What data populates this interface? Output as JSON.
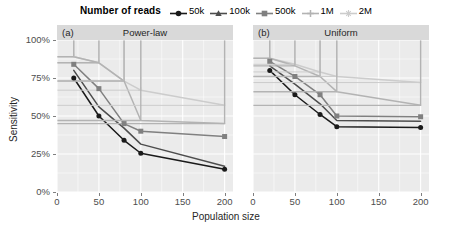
{
  "chart_data": {
    "type": "line",
    "title": "",
    "legend_title": "Number of reads",
    "legend_position": "top",
    "xlabel": "Population size",
    "ylabel": "Sensitivity",
    "xlim": [
      0,
      210
    ],
    "ylim": [
      0,
      100
    ],
    "xticks": [
      0,
      50,
      100,
      150,
      200
    ],
    "yticks": [
      0,
      25,
      50,
      75,
      100
    ],
    "ytick_labels": [
      "0%",
      "25%",
      "50%",
      "75%",
      "100%"
    ],
    "xtick_labels": [
      "0",
      "50",
      "100",
      "150",
      "200"
    ],
    "grid": true,
    "panels": [
      {
        "tag": "(a)",
        "title": "Power-law",
        "x": [
          20,
          50,
          80,
          100,
          200
        ],
        "series": [
          {
            "name": "50k",
            "color": "#1a1a1a",
            "marker": "circle",
            "values": [
              75,
              50,
              34,
              25.5,
              15
            ]
          },
          {
            "name": "100k",
            "color": "#4d4d4d",
            "marker": "triangle",
            "values": [
              80,
              56,
              42,
              31.5,
              17
            ]
          },
          {
            "name": "500k",
            "color": "#808080",
            "marker": "square",
            "values": [
              84,
              68,
              45,
              40,
              36.5
            ]
          },
          {
            "name": "1M",
            "color": "#b3b3b3",
            "marker": "plus",
            "values": [
              89,
              85,
              73,
              47,
              45
            ]
          },
          {
            "name": "2M",
            "color": "#cccccc",
            "marker": "asterisk",
            "values": [
              89,
              85,
              73,
              67,
              57
            ]
          }
        ]
      },
      {
        "tag": "(b)",
        "title": "Uniform",
        "x": [
          20,
          50,
          80,
          100,
          200
        ],
        "series": [
          {
            "name": "50k",
            "color": "#1a1a1a",
            "marker": "circle",
            "values": [
              80,
              64,
              51,
              43,
              42.5
            ]
          },
          {
            "name": "100k",
            "color": "#4d4d4d",
            "marker": "triangle",
            "values": [
              83,
              71,
              58,
              47,
              46.5
            ]
          },
          {
            "name": "500k",
            "color": "#808080",
            "marker": "square",
            "values": [
              86,
              76,
              64,
              50,
              49.5
            ]
          },
          {
            "name": "1M",
            "color": "#b3b3b3",
            "marker": "plus",
            "values": [
              88,
              83,
              76,
              66,
              57
            ]
          },
          {
            "name": "2M",
            "color": "#cccccc",
            "marker": "asterisk",
            "values": [
              88,
              84,
              79,
              76,
              72
            ]
          }
        ]
      }
    ]
  },
  "legend": {
    "title": "Number of reads",
    "items": [
      {
        "label": "50k",
        "color": "#1a1a1a",
        "marker": "circle"
      },
      {
        "label": "100k",
        "color": "#4d4d4d",
        "marker": "triangle"
      },
      {
        "label": "500k",
        "color": "#808080",
        "marker": "square"
      },
      {
        "label": "1M",
        "color": "#b3b3b3",
        "marker": "plus"
      },
      {
        "label": "2M",
        "color": "#cccccc",
        "marker": "asterisk"
      }
    ]
  },
  "colors": {
    "panel_background": "#ebebeb",
    "grid": "#ffffff",
    "strip_background": "#d9d9d9",
    "axis_text": "#4d4d4d",
    "page_background": "#ffffff"
  }
}
